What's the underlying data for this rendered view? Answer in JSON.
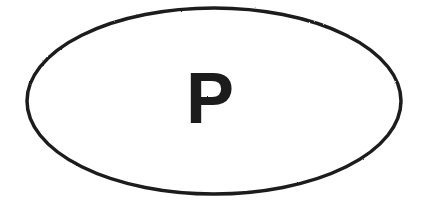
{
  "sticker": {
    "type": "vehicle-country-identification-oval",
    "code_letter": "P",
    "shape_name": "ellipse",
    "canvas": {
      "width": 427,
      "height": 208,
      "background_color": "#ffffff"
    },
    "oval": {
      "center_x": 214,
      "center_y": 101,
      "radius_x": 187,
      "radius_y": 93,
      "stroke_color": "#1c1c1c",
      "stroke_width": 3.5,
      "fill_color": "#ffffff"
    },
    "letter": {
      "text": "P",
      "color": "#1c1c1c",
      "center_x": 210,
      "baseline_y": 123,
      "font_size": 72,
      "font_weight": "bold",
      "bounds": {
        "left": 192,
        "top": 72,
        "right": 228,
        "bottom": 123,
        "width": 36,
        "height": 51
      }
    }
  }
}
